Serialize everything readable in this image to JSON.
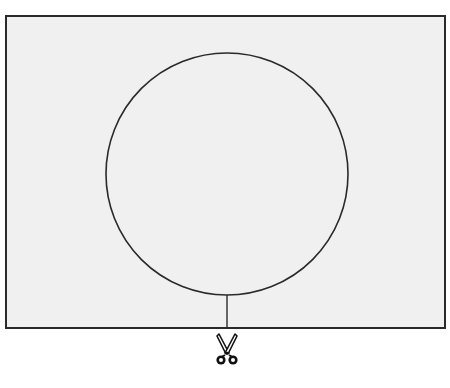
{
  "diagram": {
    "colors": {
      "paper": "#f0f0f0",
      "outline": "#2a2a2a",
      "background": "#ffffff"
    },
    "shapes": {
      "rectangle": {
        "x": 5,
        "y": 15,
        "width": 441,
        "height": 314
      },
      "circle": {
        "cx": 227,
        "cy": 174,
        "r": 121
      },
      "cut_line": {
        "x": 227,
        "y1": 295,
        "y2": 329
      }
    },
    "icons": {
      "scissors": "scissors-icon"
    }
  }
}
